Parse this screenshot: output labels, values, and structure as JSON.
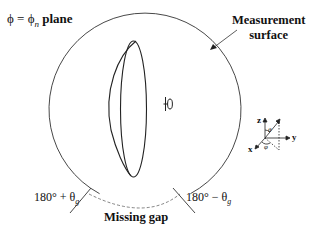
{
  "diagram": {
    "plane_label": {
      "lhs": "ϕ = ϕ",
      "subscript": "n",
      "suffix": "plane"
    },
    "measurement_surface_label": {
      "line1": "Measurement",
      "line2": "surface"
    },
    "left_angle_label": {
      "text": "180° + θ",
      "subscript": "g"
    },
    "right_angle_label": {
      "text": "180° − θ",
      "subscript": "g"
    },
    "gap_label": "Missing gap",
    "source_symbol": "dipole-antenna-icon",
    "object_shape": "lens-shaped scatterer",
    "axes": {
      "z": "z",
      "y": "y",
      "x": "x",
      "theta": "θ",
      "phi": "φ"
    },
    "colors": {
      "stroke": "#222222",
      "dashed_gap": "#555555",
      "background": "#ffffff"
    }
  }
}
